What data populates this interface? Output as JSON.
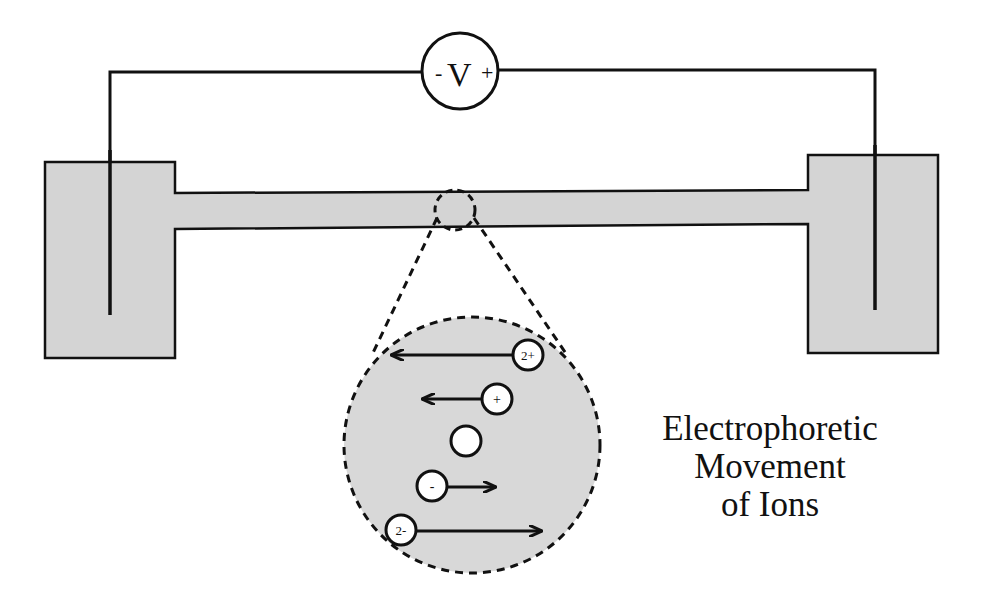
{
  "voltmeter": {
    "minus": "-",
    "symbol": "V",
    "plus": "+"
  },
  "caption": {
    "line1": "Electrophoretic",
    "line2": "Movement",
    "line3": "of Ions"
  },
  "ions": [
    {
      "label": "2+",
      "direction": "left",
      "arrow_length": "long"
    },
    {
      "label": "+",
      "direction": "left",
      "arrow_length": "short"
    },
    {
      "label": "",
      "direction": "none",
      "arrow_length": "none"
    },
    {
      "label": "-",
      "direction": "right",
      "arrow_length": "short"
    },
    {
      "label": "2-",
      "direction": "right",
      "arrow_length": "long"
    }
  ],
  "colors": {
    "fill": "#d4d4d4",
    "stroke": "#111111"
  }
}
